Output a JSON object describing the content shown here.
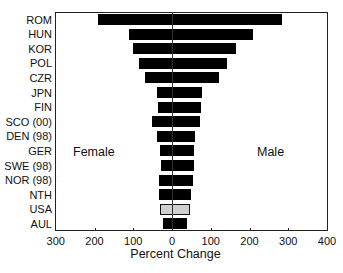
{
  "chart_data": {
    "type": "bar",
    "orientation": "horizontal",
    "title": "",
    "xlabel": "Percent Change",
    "ylabel": "",
    "categories": [
      "ROM",
      "HUN",
      "KOR",
      "POL",
      "CZR",
      "JPN",
      "FIN",
      "SCO (00)",
      "DEN (98)",
      "GER",
      "SWE (98)",
      "NOR (98)",
      "NTH",
      "USA",
      "AUL"
    ],
    "series": [
      {
        "name": "Female",
        "direction": "left",
        "values": [
          191,
          111,
          101,
          85,
          70,
          39,
          36,
          52,
          39,
          31,
          28,
          34,
          34,
          31,
          23
        ]
      },
      {
        "name": "Male",
        "direction": "right",
        "values": [
          284,
          209,
          165,
          141,
          121,
          77,
          75,
          72,
          59,
          57,
          57,
          54,
          49,
          46,
          39
        ]
      }
    ],
    "highlighted_category": "USA",
    "colors": {
      "default_bar": "#000000",
      "highlight_bar": "#cfcfcf"
    },
    "xlim_left": 300,
    "xlim_right": 400,
    "x_ticks": [
      {
        "value": 300,
        "label": "300"
      },
      {
        "value": 200,
        "label": "200"
      },
      {
        "value": 100,
        "label": "100"
      },
      {
        "value": 0,
        "label": "0"
      },
      {
        "value": 100,
        "label": "100"
      },
      {
        "value": 200,
        "label": "200"
      },
      {
        "value": 300,
        "label": "300"
      },
      {
        "value": 400,
        "label": "400"
      }
    ],
    "annotations": {
      "left": "Female",
      "right": "Male"
    },
    "grid": false,
    "legend": "none"
  }
}
